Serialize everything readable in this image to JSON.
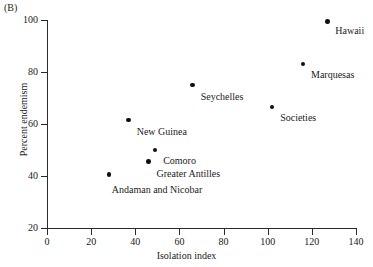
{
  "figure": {
    "panel_letter": "(B)"
  },
  "chart_data": {
    "type": "scatter",
    "title": "",
    "xlabel": "Isolation index",
    "ylabel": "Percent endemism",
    "xlim": [
      0,
      140
    ],
    "ylim": [
      20,
      100
    ],
    "xticks": [
      0,
      20,
      40,
      60,
      80,
      100,
      120,
      140
    ],
    "yticks": [
      20,
      40,
      60,
      80,
      100
    ],
    "xtick_labels": [
      "0",
      "20",
      "40",
      "60",
      "80",
      "100",
      "120",
      "140"
    ],
    "ytick_labels": [
      "20",
      "40",
      "60",
      "80",
      "100"
    ],
    "grid": false,
    "legend": null,
    "points": [
      {
        "label": "Hawaii",
        "x": 127,
        "y": 99.5,
        "label_dx": 8,
        "label_dy": 4
      },
      {
        "label": "Marquesas",
        "x": 116,
        "y": 83,
        "label_dx": 8,
        "label_dy": 5
      },
      {
        "label": "Societies",
        "x": 102,
        "y": 66.5,
        "label_dx": 8,
        "label_dy": 5
      },
      {
        "label": "Seychelles",
        "x": 66,
        "y": 75,
        "label_dx": 8,
        "label_dy": 6
      },
      {
        "label": "New Guinea",
        "x": 37,
        "y": 61.5,
        "label_dx": 8,
        "label_dy": 6
      },
      {
        "label": "Comoro",
        "x": 49,
        "y": 50,
        "label_dx": 8,
        "label_dy": 5
      },
      {
        "label": "Greater Antilles",
        "x": 46,
        "y": 45.5,
        "label_dx": 8,
        "label_dy": 6
      },
      {
        "label": "Andaman and Nicobar",
        "x": 28,
        "y": 40.5,
        "label_dx": 3,
        "label_dy": 9
      }
    ]
  }
}
